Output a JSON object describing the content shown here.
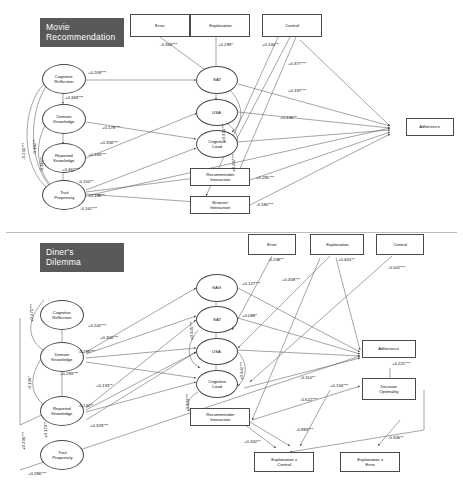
{
  "figure": {
    "type": "sem-path-diagram",
    "panels": [
      "Movie Recommendation",
      "Diner's Dilemma"
    ]
  },
  "panel_movie": {
    "title": "Movie\nRecommendation",
    "nodes": {
      "cognitive_reflection": "Cognitive\nReflection",
      "domain_knowledge": "Domain\nKnowledge",
      "reported_knowledge": "Reported\nKnowledge",
      "trait_propensity": "Trait\nPropensity",
      "error": "Error",
      "explanation": "Explanation",
      "control": "Control",
      "sat": "SAT",
      "usa": "USA",
      "cognitive_load": "Cognitive\nLoad",
      "recommender_interaction": "Recommender\nInteraction",
      "browser_interaction": "Browser\nInteraction",
      "adherence": "Adherence"
    },
    "coefficients": {
      "cr_to_sat": "+0.209***",
      "cr_to_dk": "+0.369***",
      "dk_to_cload": "+0.178***",
      "rk_to_usa": "+0.169***",
      "rk_to_tp": "+0.462***",
      "tp_to_recint": "+0.358***",
      "tp_a": "-0.150**",
      "tp_b": "+0.188**",
      "tp_c": "-0.161***",
      "curve_1": "-0.182**",
      "curve_2": "-0.116**",
      "curve_3": "-0.231***",
      "error_to_sat": "-0.369***",
      "explanation_to_sat": "+0.299*",
      "control_to_sat": "+0.240**",
      "control_b": "+0.377***",
      "control_c": "+0.197***",
      "control_d": "+0.136**",
      "recint_to_adh": "+0.285***",
      "browint_to_adh": "-0.180***",
      "vert_a": "+0.371***",
      "vert_b": "+0.487***"
    }
  },
  "panel_diner": {
    "title": "Diner's\nDilemma",
    "nodes": {
      "cognitive_reflection": "Cognitive\nReflection",
      "domain_knowledge": "Domain\nKnowledge",
      "reported_knowledge": "Reported\nKnowledge",
      "trait_propensity": "Trait\nPropensity",
      "error": "Error",
      "explanation": "Explanation",
      "control": "Control",
      "sag": "SAG",
      "sat": "SAT",
      "usa": "USA",
      "cognitive_load": "Cognitive\nLoad",
      "recommender_interaction": "Recommender\nInteraction",
      "adherence": "Adherence",
      "decision_optimality": "Decision\nOptimality",
      "explanation_x_control": "Explanation x\nControl",
      "explanation_x_error": "Explanation x\nError"
    },
    "coefficients": {
      "cr_curve": "+0.471***",
      "dk_a": "+0.242***",
      "dk_b": "+0.300***",
      "dk_c": "-0.289***",
      "dk_to_rk": "+0.289***",
      "rk_a": "+0.133**",
      "rk_b": "-0.140**",
      "curve_left_1": "-0.136*",
      "curve_left_2": "+0.206***",
      "curve_left_3": "+0.173**",
      "tp_to_usa": "+0.329***",
      "bottom_long": "+0.286***",
      "sag_to_sat": "+0.127***",
      "sat_label": "+0.088*",
      "sat_vert": "+0.345***",
      "usa_vert": "+0.342***",
      "cload_vert": "+0.303***",
      "sag_right": "+0.458***",
      "error_to_node": "-0.238**",
      "explanation_to_node": "+0.405**",
      "control_to_node": "-0.501***",
      "adh_to_do": "+0.221***",
      "mid_a": "-0.110**",
      "mid_b": "-0.622***",
      "mid_c": "+0.156***",
      "recint_to_exc": "+0.342**",
      "exc_line": "-0.883***",
      "exe_line": "-0.336**"
    }
  }
}
